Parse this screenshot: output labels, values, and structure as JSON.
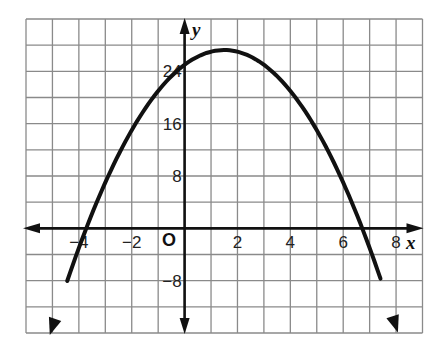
{
  "chart_data": {
    "type": "line",
    "title": "",
    "xlabel": "x",
    "ylabel": "y",
    "origin_label": "O",
    "function": "y = -x^2 + 3x + 25",
    "xlim": [
      -6,
      9
    ],
    "ylim": [
      -16,
      32
    ],
    "grid": true,
    "grid_x_step": 1,
    "grid_y_step": 4,
    "x_ticks": [
      {
        "value": -4,
        "label": "−4"
      },
      {
        "value": -2,
        "label": "−2"
      },
      {
        "value": 2,
        "label": "2"
      },
      {
        "value": 4,
        "label": "4"
      },
      {
        "value": 6,
        "label": "6"
      },
      {
        "value": 8,
        "label": "8"
      }
    ],
    "y_ticks": [
      {
        "value": 24,
        "label": "24"
      },
      {
        "value": 16,
        "label": "16"
      },
      {
        "value": 8,
        "label": "8"
      },
      {
        "value": -8,
        "label": "−8"
      }
    ],
    "series": [
      {
        "name": "parabola",
        "color": "#111111",
        "arrows_both_ends": true,
        "x_range": [
          -5.1,
          8.07
        ],
        "coefficients": {
          "a": -1,
          "b": 3,
          "c": 25
        },
        "key_points": {
          "vertex": [
            1.5,
            27.25
          ],
          "y_intercept": [
            0,
            25
          ],
          "x_intercepts": [
            -3.72,
            6.72
          ]
        },
        "x": [
          -5,
          -4,
          -3,
          -2,
          -1,
          0,
          1,
          1.5,
          2,
          3,
          4,
          5,
          6,
          7,
          8
        ],
        "y": [
          -15,
          -3,
          7,
          15,
          21,
          25,
          27,
          27.25,
          27,
          25,
          21,
          15,
          7,
          -3,
          -15
        ]
      }
    ]
  },
  "colors": {
    "grid": "#8a8a8a",
    "axis": "#111111",
    "curve": "#111111",
    "background": "#ffffff"
  }
}
